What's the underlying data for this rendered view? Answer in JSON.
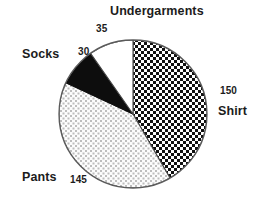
{
  "chart_data": {
    "type": "pie",
    "title": "",
    "subtitle": "",
    "xlabel": "",
    "ylabel": "",
    "legend_position": "none",
    "grid": false,
    "total": 360,
    "categories": [
      "Shirt",
      "Pants",
      "Socks",
      "Undergarments"
    ],
    "values": [
      150,
      145,
      30,
      35
    ],
    "slices": [
      {
        "label": "Shirt",
        "value": 150,
        "value_text": "150",
        "fill": "checkerboard-dark",
        "color": "#1a1a1a",
        "start_angle_deg": 0,
        "end_angle_deg": 150
      },
      {
        "label": "Pants",
        "value": 145,
        "value_text": "145",
        "fill": "stipple-light",
        "color": "#f2f2f2",
        "start_angle_deg": 150,
        "end_angle_deg": 295
      },
      {
        "label": "Socks",
        "value": 30,
        "value_text": "30",
        "fill": "solid-black",
        "color": "#0d0d0d",
        "start_angle_deg": 295,
        "end_angle_deg": 325
      },
      {
        "label": "Undergarments",
        "value": 35,
        "value_text": "35",
        "fill": "solid-white",
        "color": "#ffffff",
        "start_angle_deg": 325,
        "end_angle_deg": 360
      }
    ]
  },
  "labels": {
    "undergarments": {
      "name": "Undergarments",
      "value": "35"
    },
    "shirt": {
      "name": "Shirt",
      "value": "150"
    },
    "socks": {
      "name": "Socks",
      "value": "30"
    },
    "pants": {
      "name": "Pants",
      "value": "145"
    }
  },
  "style": {
    "background": "#ffffff",
    "outline": "#555555",
    "text": "#1c1c1c"
  }
}
